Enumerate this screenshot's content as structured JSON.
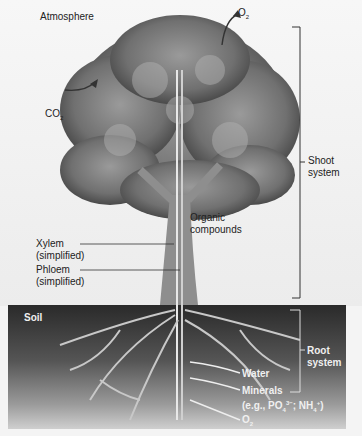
{
  "regions": {
    "atmosphere": "Atmosphere",
    "soil": "Soil"
  },
  "labels": {
    "o2_top": {
      "main": "O",
      "sub": "2"
    },
    "co2": {
      "main": "CO",
      "sub": "2"
    },
    "organic_line1": "Organic",
    "organic_line2": "compounds",
    "xylem_line1": "Xylem",
    "xylem_line2": "(simplified)",
    "phloem_line1": "Phloem",
    "phloem_line2": "(simplified)",
    "water": "Water",
    "minerals_line1": "Minerals",
    "minerals_line2_prefix": "(e.g., PO",
    "minerals_po4_sub": "4",
    "minerals_po4_sup": "3−",
    "minerals_mid": "; NH",
    "minerals_nh4_sub": "4",
    "minerals_nh4_sup": "+",
    "minerals_suffix": ")",
    "o2_bottom": {
      "main": "O",
      "sub": "2"
    }
  },
  "brackets": {
    "shoot_line1": "Shoot",
    "shoot_line2": "system",
    "root_line1": "Root",
    "root_line2": "system"
  }
}
